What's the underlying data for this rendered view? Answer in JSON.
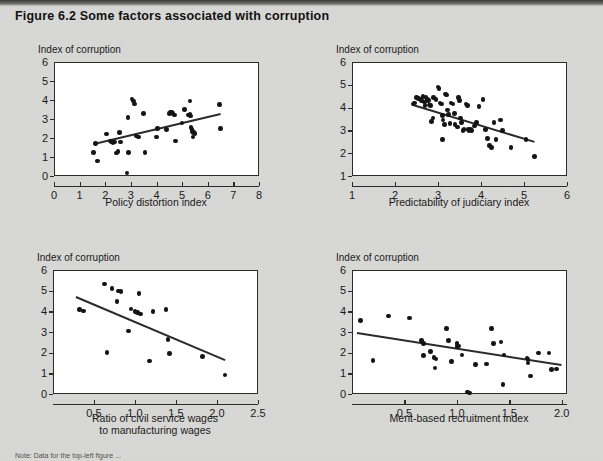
{
  "figure": {
    "title": "Figure 6.2  Some factors associated with corruption",
    "note": "Note: Data for the top-left figure ..."
  },
  "chart_data": [
    {
      "id": "policy-distortion",
      "type": "scatter",
      "title": "",
      "ylabel": "Index of corruption",
      "xlabel": "Policy distortion index",
      "xlabel_line2": "",
      "xlim": [
        0,
        8
      ],
      "ylim": [
        0,
        6
      ],
      "xticks": [
        0,
        1,
        2,
        3,
        4,
        5,
        6,
        7,
        8
      ],
      "yticks": [
        0,
        1,
        2,
        3,
        4,
        5,
        6
      ],
      "grid": false,
      "trendline": {
        "x1": 1.55,
        "y1": 1.72,
        "x2": 6.5,
        "y2": 3.3
      },
      "points": [
        [
          1.55,
          1.25
        ],
        [
          1.62,
          1.72
        ],
        [
          1.7,
          0.78
        ],
        [
          2.05,
          2.2
        ],
        [
          2.2,
          1.85
        ],
        [
          2.25,
          1.8
        ],
        [
          2.3,
          1.75
        ],
        [
          2.35,
          1.78
        ],
        [
          2.45,
          1.2
        ],
        [
          2.5,
          1.3
        ],
        [
          2.55,
          2.3
        ],
        [
          2.6,
          1.8
        ],
        [
          2.85,
          0.15
        ],
        [
          2.88,
          3.08
        ],
        [
          2.9,
          1.25
        ],
        [
          3.05,
          4.05
        ],
        [
          3.1,
          3.95
        ],
        [
          3.15,
          3.8
        ],
        [
          3.2,
          2.1
        ],
        [
          3.3,
          2.05
        ],
        [
          3.5,
          3.3
        ],
        [
          3.55,
          1.25
        ],
        [
          4.0,
          2.05
        ],
        [
          4.05,
          2.5
        ],
        [
          4.4,
          2.45
        ],
        [
          4.5,
          3.3
        ],
        [
          4.55,
          3.35
        ],
        [
          4.6,
          3.35
        ],
        [
          4.65,
          3.3
        ],
        [
          4.7,
          3.2
        ],
        [
          4.75,
          1.85
        ],
        [
          5.0,
          2.8
        ],
        [
          5.1,
          3.5
        ],
        [
          5.25,
          3.2
        ],
        [
          5.3,
          3.25
        ],
        [
          5.32,
          3.15
        ],
        [
          5.35,
          2.55
        ],
        [
          5.38,
          2.45
        ],
        [
          5.4,
          2.35
        ],
        [
          5.42,
          2.05
        ],
        [
          5.45,
          2.3
        ],
        [
          5.3,
          3.95
        ],
        [
          5.5,
          2.25
        ],
        [
          6.45,
          3.75
        ],
        [
          6.5,
          2.5
        ]
      ]
    },
    {
      "id": "judiciary-predictability",
      "type": "scatter",
      "title": "",
      "ylabel": "Index of corruption",
      "xlabel": "Predictability of judiciary index",
      "xlabel_line2": "",
      "xlim": [
        1,
        6
      ],
      "ylim": [
        1,
        6
      ],
      "xticks": [
        1,
        2,
        3,
        4,
        5,
        6
      ],
      "yticks": [
        1,
        2,
        3,
        4,
        5,
        6
      ],
      "grid": false,
      "trendline": {
        "x1": 2.42,
        "y1": 4.17,
        "x2": 5.25,
        "y2": 2.55
      },
      "points": [
        [
          2.42,
          4.15
        ],
        [
          2.45,
          4.2
        ],
        [
          2.5,
          4.45
        ],
        [
          2.55,
          4.4
        ],
        [
          2.6,
          4.35
        ],
        [
          2.62,
          4.3
        ],
        [
          2.65,
          4.48
        ],
        [
          2.68,
          4.25
        ],
        [
          2.7,
          4.1
        ],
        [
          2.72,
          4.45
        ],
        [
          2.75,
          4.35
        ],
        [
          2.78,
          4.3
        ],
        [
          2.8,
          4.12
        ],
        [
          2.82,
          4.08
        ],
        [
          2.85,
          3.4
        ],
        [
          2.88,
          3.55
        ],
        [
          2.9,
          4.45
        ],
        [
          2.95,
          4.35
        ],
        [
          3.0,
          4.9
        ],
        [
          3.02,
          4.85
        ],
        [
          3.05,
          4.2
        ],
        [
          3.08,
          4.15
        ],
        [
          3.1,
          3.65
        ],
        [
          3.12,
          3.45
        ],
        [
          3.15,
          3.25
        ],
        [
          3.18,
          4.6
        ],
        [
          3.2,
          4.55
        ],
        [
          3.22,
          3.9
        ],
        [
          3.25,
          3.7
        ],
        [
          3.28,
          3.3
        ],
        [
          3.3,
          4.2
        ],
        [
          3.35,
          4.15
        ],
        [
          3.38,
          3.75
        ],
        [
          3.4,
          3.25
        ],
        [
          3.45,
          3.15
        ],
        [
          3.48,
          4.45
        ],
        [
          3.5,
          4.3
        ],
        [
          3.52,
          3.55
        ],
        [
          3.55,
          3.35
        ],
        [
          3.58,
          3.0
        ],
        [
          3.6,
          3.05
        ],
        [
          3.65,
          4.15
        ],
        [
          3.68,
          4.1
        ],
        [
          3.7,
          3.05
        ],
        [
          3.72,
          3.0
        ],
        [
          3.75,
          3.05
        ],
        [
          3.78,
          3.0
        ],
        [
          3.85,
          3.2
        ],
        [
          3.9,
          3.35
        ],
        [
          3.95,
          4.05
        ],
        [
          4.05,
          4.35
        ],
        [
          4.1,
          3.05
        ],
        [
          4.15,
          2.65
        ],
        [
          4.2,
          2.35
        ],
        [
          4.25,
          2.25
        ],
        [
          4.3,
          3.35
        ],
        [
          4.35,
          2.6
        ],
        [
          4.45,
          3.45
        ],
        [
          4.5,
          3.0
        ],
        [
          4.7,
          2.25
        ],
        [
          5.05,
          2.6
        ],
        [
          5.25,
          1.85
        ],
        [
          3.1,
          2.6
        ]
      ]
    },
    {
      "id": "civil-service-wages",
      "type": "scatter",
      "title": "",
      "ylabel": "Index of corruption",
      "xlabel": "Ratio of civil service wages",
      "xlabel_line2": "to manufacturing wages",
      "xlim": [
        0,
        2.5
      ],
      "ylim": [
        0,
        6
      ],
      "xticks": [
        0.5,
        1.0,
        1.5,
        2.0,
        2.5
      ],
      "yticks": [
        0,
        1,
        2,
        3,
        4,
        5,
        6
      ],
      "grid": false,
      "trendline": {
        "x1": 0.28,
        "y1": 4.72,
        "x2": 2.1,
        "y2": 1.66
      },
      "points": [
        [
          0.32,
          4.08
        ],
        [
          0.37,
          4.02
        ],
        [
          0.63,
          5.32
        ],
        [
          0.66,
          2.0
        ],
        [
          0.72,
          5.1
        ],
        [
          0.78,
          4.48
        ],
        [
          0.8,
          4.98
        ],
        [
          0.83,
          4.95
        ],
        [
          0.92,
          3.05
        ],
        [
          0.95,
          4.12
        ],
        [
          1.0,
          3.98
        ],
        [
          1.03,
          3.95
        ],
        [
          1.05,
          4.85
        ],
        [
          1.07,
          3.88
        ],
        [
          1.18,
          1.6
        ],
        [
          1.22,
          3.98
        ],
        [
          1.38,
          4.1
        ],
        [
          1.4,
          2.65
        ],
        [
          1.42,
          1.95
        ],
        [
          1.82,
          1.82
        ],
        [
          2.1,
          0.92
        ]
      ]
    },
    {
      "id": "merit-recruitment",
      "type": "scatter",
      "title": "",
      "ylabel": "Index of corruption",
      "xlabel": "Merit-based recruitment index",
      "xlabel_line2": "",
      "xlim": [
        0,
        2.05
      ],
      "ylim": [
        0,
        6
      ],
      "xticks": [
        0.5,
        1.0,
        1.5,
        2.0
      ],
      "yticks": [
        0,
        1,
        2,
        3,
        4,
        5,
        6
      ],
      "grid": false,
      "trendline": {
        "x1": 0.05,
        "y1": 3.0,
        "x2": 2.0,
        "y2": 1.45
      },
      "points": [
        [
          0.08,
          3.55
        ],
        [
          0.2,
          1.62
        ],
        [
          0.35,
          3.78
        ],
        [
          0.55,
          3.68
        ],
        [
          0.66,
          2.6
        ],
        [
          0.68,
          2.45
        ],
        [
          0.68,
          1.85
        ],
        [
          0.75,
          2.05
        ],
        [
          0.78,
          1.78
        ],
        [
          0.79,
          1.25
        ],
        [
          0.8,
          1.7
        ],
        [
          0.9,
          3.18
        ],
        [
          0.92,
          2.6
        ],
        [
          0.95,
          1.58
        ],
        [
          1.0,
          2.45
        ],
        [
          1.0,
          2.3
        ],
        [
          1.02,
          2.32
        ],
        [
          1.05,
          1.88
        ],
        [
          1.1,
          0.1
        ],
        [
          1.12,
          0.05
        ],
        [
          1.18,
          1.42
        ],
        [
          1.28,
          1.45
        ],
        [
          1.33,
          3.18
        ],
        [
          1.35,
          2.45
        ],
        [
          1.42,
          2.52
        ],
        [
          1.44,
          0.45
        ],
        [
          1.45,
          1.88
        ],
        [
          1.67,
          1.75
        ],
        [
          1.68,
          1.68
        ],
        [
          1.68,
          1.5
        ],
        [
          1.7,
          0.88
        ],
        [
          1.78,
          1.98
        ],
        [
          1.88,
          1.98
        ],
        [
          1.9,
          1.18
        ],
        [
          1.95,
          1.2
        ]
      ]
    }
  ]
}
